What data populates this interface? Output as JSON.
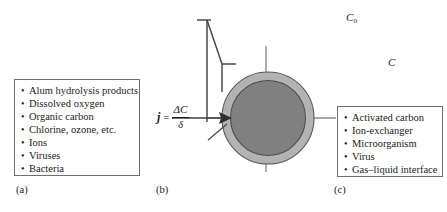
{
  "figure": {
    "type": "schematic-diagram"
  },
  "panel_a": {
    "caption": "(a)",
    "bullet": "•",
    "items": [
      "Alum hydrolysis products",
      "Dissolved oxygen",
      "Organic carbon",
      "Chlorine, ozone, etc.",
      "Ions",
      "Viruses",
      "Bacteria"
    ]
  },
  "panel_b": {
    "caption": "(b)",
    "labels": {
      "bulk_concentration": "C",
      "bulk_concentration_subscript": "o",
      "surface_concentration": "C",
      "boundary_layer": "δ"
    },
    "flux_equation": {
      "symbol": "j",
      "equals": "=",
      "numerator": "ΔC",
      "denominator": "δ"
    },
    "colors": {
      "particle_core": "#808080",
      "boundary_layer": "#b3b3b3",
      "outline": "#555555",
      "profile_line": "#4a4a4a",
      "axis_line": "#8c8c8c"
    }
  },
  "panel_c": {
    "caption": "(c)",
    "bullet": "•",
    "items": [
      "Activated carbon",
      "Ion-exchanger",
      "Microorganism",
      "Virus",
      "Gas–liquid interface"
    ]
  }
}
